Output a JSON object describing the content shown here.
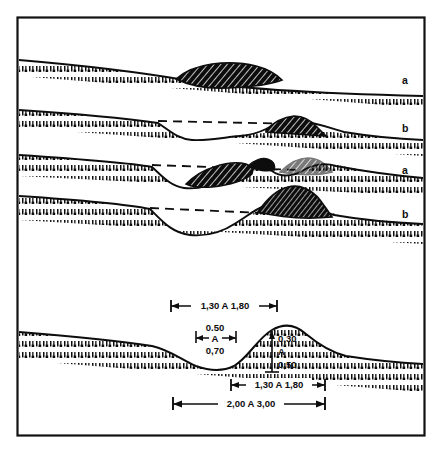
{
  "figure": {
    "kind": "terrain-cross-section-diagram",
    "border_color": "#111111",
    "ink_color": "#0d0d0d",
    "background": "#ffffff",
    "panel_labels": [
      {
        "id": "p1",
        "label": "a"
      },
      {
        "id": "p2",
        "label": "b"
      },
      {
        "id": "p3",
        "label": "a"
      },
      {
        "id": "p4",
        "label": "b"
      }
    ],
    "dimensions": [
      {
        "id": "d-top-width",
        "text": "1,30 A 1,80",
        "orientation": "horizontal"
      },
      {
        "id": "d-hollow-upper",
        "text": "0,50",
        "orientation": "stacked-label"
      },
      {
        "id": "d-hollow-mid",
        "text": "A",
        "orientation": "stacked-label"
      },
      {
        "id": "d-hollow-lower",
        "text": "0,70",
        "orientation": "stacked-label"
      },
      {
        "id": "d-height-upper",
        "text": "0,30",
        "orientation": "vertical-label"
      },
      {
        "id": "d-height-mid",
        "text": "A",
        "orientation": "vertical-label"
      },
      {
        "id": "d-height-lower",
        "text": "0,50",
        "orientation": "vertical-label"
      },
      {
        "id": "d-mound-width",
        "text": "1,30 A 1,80",
        "orientation": "horizontal"
      },
      {
        "id": "d-total-width",
        "text": "2,00 A 3,00",
        "orientation": "horizontal"
      }
    ]
  }
}
